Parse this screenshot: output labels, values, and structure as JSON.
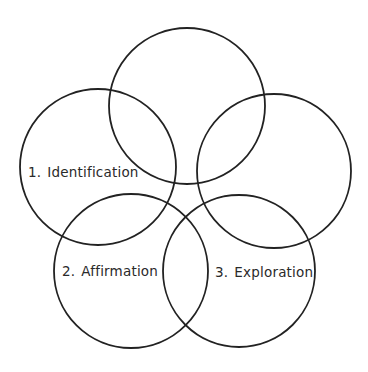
{
  "diagram": {
    "type": "five-circle overlapping diagram",
    "stroke_color": "#222222",
    "background_color": "#ffffff",
    "circles": [
      {
        "id": "top",
        "cx": 187,
        "cy": 106,
        "r": 78,
        "label": ""
      },
      {
        "id": "left",
        "cx": 98,
        "cy": 167,
        "r": 78,
        "label": "Identification",
        "number": "1."
      },
      {
        "id": "right",
        "cx": 274,
        "cy": 171,
        "r": 77,
        "label": ""
      },
      {
        "id": "bottom-left",
        "cx": 131,
        "cy": 271,
        "r": 77,
        "label": "Affirmation",
        "number": "2."
      },
      {
        "id": "bottom-right",
        "cx": 239,
        "cy": 271,
        "r": 76,
        "label": "Exploration",
        "number": "3."
      }
    ],
    "labels": [
      {
        "number": "1.",
        "text": "Identification"
      },
      {
        "number": "2.",
        "text": "Affirmation"
      },
      {
        "number": "3.",
        "text": "Exploration"
      }
    ]
  }
}
